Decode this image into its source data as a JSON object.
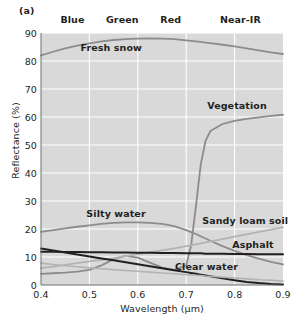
{
  "figure": {
    "panel_label": "(a)"
  },
  "chart_data": {
    "type": "line",
    "title": "",
    "xlabel": "Wavelength (µm)",
    "ylabel": "Reflectance (%)",
    "xlim": [
      0.4,
      0.9
    ],
    "ylim": [
      0,
      90
    ],
    "xticks": [
      "0.4",
      "0.5",
      "0.6",
      "0.7",
      "0.8",
      "0.9"
    ],
    "xtick_values": [
      0.4,
      0.5,
      0.6,
      0.7,
      0.8,
      0.9
    ],
    "yticks": [
      "0",
      "10",
      "20",
      "30",
      "40",
      "50",
      "60",
      "70",
      "80",
      "90"
    ],
    "ytick_values": [
      0,
      10,
      20,
      30,
      40,
      50,
      60,
      70,
      80,
      90
    ],
    "grid": true,
    "grid_color": "#ffffff",
    "plot_bg": "#d9d9d9",
    "legend_position": "inline-annotations",
    "bands": [
      {
        "name": "Blue",
        "label_x": 0.465,
        "range": [
          0.4,
          0.5
        ]
      },
      {
        "name": "Green",
        "label_x": 0.568,
        "range": [
          0.5,
          0.6
        ]
      },
      {
        "name": "Red",
        "label_x": 0.668,
        "range": [
          0.6,
          0.7
        ]
      },
      {
        "name": "Near-IR",
        "label_x": 0.812,
        "range": [
          0.7,
          0.9
        ]
      }
    ],
    "band_divider_values": [
      0.5,
      0.6,
      0.7,
      0.8
    ],
    "x": [
      0.4,
      0.425,
      0.45,
      0.475,
      0.5,
      0.525,
      0.55,
      0.575,
      0.6,
      0.625,
      0.65,
      0.675,
      0.7,
      0.71,
      0.72,
      0.73,
      0.74,
      0.75,
      0.775,
      0.8,
      0.825,
      0.85,
      0.875,
      0.9
    ],
    "series": [
      {
        "name": "Fresh snow",
        "color": "#8c8c8c",
        "width": 1.8,
        "label_x": 0.545,
        "label_y": 84.5,
        "values": [
          82.0,
          83.3,
          84.5,
          85.5,
          86.3,
          87.0,
          87.5,
          87.8,
          88.0,
          88.1,
          88.0,
          87.8,
          87.4,
          87.2,
          87.0,
          86.8,
          86.6,
          86.4,
          85.8,
          85.2,
          84.5,
          83.8,
          83.1,
          82.5
        ]
      },
      {
        "name": "Vegetation",
        "color": "#8c8c8c",
        "width": 1.8,
        "label_x": 0.805,
        "label_y": 64.0,
        "values": [
          4.0,
          4.2,
          4.4,
          4.8,
          5.4,
          7.0,
          9.2,
          10.4,
          9.8,
          8.0,
          6.2,
          5.4,
          7.0,
          14.0,
          28.0,
          43.0,
          51.5,
          55.0,
          57.5,
          58.6,
          59.3,
          59.9,
          60.4,
          60.8
        ]
      },
      {
        "name": "Silty water",
        "color": "#8c8c8c",
        "width": 1.8,
        "label_x": 0.555,
        "label_y": 25.2,
        "values": [
          19.0,
          19.6,
          20.2,
          20.8,
          21.3,
          21.8,
          22.2,
          22.4,
          22.4,
          22.2,
          21.8,
          21.0,
          19.6,
          18.9,
          18.2,
          17.4,
          16.6,
          15.8,
          13.9,
          12.2,
          10.7,
          9.4,
          8.3,
          7.4
        ]
      },
      {
        "name": "Sandy loam soil",
        "color": "#b3b3b3",
        "width": 1.8,
        "label_x": 0.822,
        "label_y": 23.0,
        "values": [
          6.0,
          6.6,
          7.2,
          7.8,
          8.4,
          9.0,
          9.6,
          10.3,
          11.0,
          11.7,
          12.4,
          13.1,
          13.9,
          14.2,
          14.5,
          14.9,
          15.2,
          15.6,
          16.4,
          17.3,
          18.1,
          19.0,
          19.8,
          20.6
        ]
      },
      {
        "name": "Asphalt",
        "color": "#231f20",
        "width": 2.0,
        "label_x": 0.838,
        "label_y": 14.2,
        "values": [
          11.9,
          11.9,
          11.8,
          11.8,
          11.7,
          11.7,
          11.6,
          11.6,
          11.5,
          11.5,
          11.4,
          11.4,
          11.3,
          11.3,
          11.3,
          11.3,
          11.2,
          11.2,
          11.2,
          11.1,
          11.1,
          11.0,
          11.0,
          11.0
        ]
      },
      {
        "name": "Clear water",
        "color": "#231f20",
        "width": 2.0,
        "label_x": 0.742,
        "label_y": 6.5,
        "values": [
          13.0,
          12.3,
          11.6,
          10.9,
          10.2,
          9.5,
          8.8,
          8.1,
          7.4,
          6.7,
          6.0,
          5.3,
          4.6,
          4.3,
          4.0,
          3.7,
          3.4,
          3.1,
          2.4,
          1.7,
          1.1,
          0.7,
          0.4,
          0.2
        ]
      },
      {
        "name": "lower-water-tail",
        "color": "#b3b3b3",
        "width": 1.6,
        "label_x": null,
        "label_y": null,
        "values": [
          7.8,
          7.3,
          6.9,
          6.5,
          6.1,
          5.8,
          5.5,
          5.2,
          4.9,
          4.6,
          4.3,
          4.0,
          3.7,
          3.6,
          3.5,
          3.4,
          3.2,
          3.1,
          2.8,
          2.5,
          2.2,
          1.9,
          1.7,
          1.4
        ]
      }
    ]
  }
}
